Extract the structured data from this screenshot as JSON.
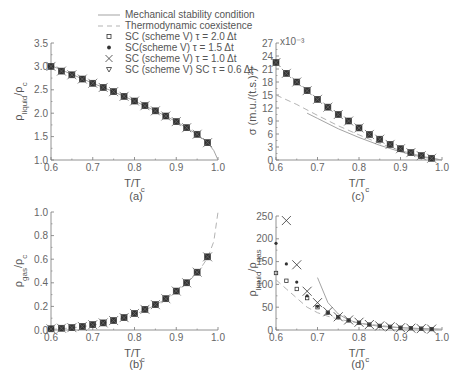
{
  "figure": {
    "legend": [
      {
        "marker": "solid-line",
        "label": "Mechanical stability condition"
      },
      {
        "marker": "dashed-line",
        "label": "Thermodynamic coexistence"
      },
      {
        "marker": "open-square",
        "label": "SC  (scheme V) τ = 2.0 Δt"
      },
      {
        "marker": "filled-circle",
        "label": "SC(scheme V) τ = 1.5 Δt"
      },
      {
        "marker": "cross",
        "label": "SC (scheme V) τ = 1.0 Δt"
      },
      {
        "marker": "open-triangle-down",
        "label": "SC (scheme V) SC τ = 0.6 Δt"
      }
    ],
    "colors": {
      "axis": "#777777",
      "marker": "#333333",
      "solid_line": "#999999",
      "dashed_line": "#aaaaaa",
      "text": "#555555"
    }
  },
  "chart_data": [
    {
      "panel": "(a)",
      "type": "line",
      "xlabel": "T/T_c",
      "ylabel": "ρ_liquid/ρ_c",
      "xlim": [
        0.6,
        1.0
      ],
      "ylim": [
        1.0,
        3.5
      ],
      "xticks": [
        "0.6",
        "0.7",
        "0.8",
        "0.9",
        "1.0"
      ],
      "yticks": [
        "1.0",
        "1.5",
        "2.0",
        "2.5",
        "3.0",
        "3.5"
      ],
      "x": [
        0.6,
        0.625,
        0.65,
        0.675,
        0.7,
        0.725,
        0.75,
        0.775,
        0.8,
        0.825,
        0.85,
        0.875,
        0.9,
        0.925,
        0.95,
        0.975
      ],
      "series": [
        {
          "name": "SC (scheme V) markers (all τ overlap)",
          "values": [
            3.0,
            2.9,
            2.82,
            2.73,
            2.64,
            2.55,
            2.46,
            2.36,
            2.26,
            2.16,
            2.05,
            1.94,
            1.82,
            1.69,
            1.55,
            1.37
          ]
        },
        {
          "name": "Mechanical stability condition",
          "line": "solid",
          "x": [
            0.6,
            0.65,
            0.7,
            0.75,
            0.8,
            0.85,
            0.9,
            0.95,
            0.975,
            0.99,
            1.0
          ],
          "values": [
            3.02,
            2.83,
            2.64,
            2.46,
            2.26,
            2.05,
            1.82,
            1.55,
            1.37,
            1.2,
            1.0
          ]
        }
      ]
    },
    {
      "panel": "(b)",
      "type": "line",
      "xlabel": "T/T_c",
      "ylabel": "ρ_gas/ρ_c",
      "xlim": [
        0.6,
        1.0
      ],
      "ylim": [
        0.0,
        1.0
      ],
      "xticks": [
        "0.6",
        "0.7",
        "0.8",
        "0.9",
        "1.0"
      ],
      "yticks": [
        "0.0",
        "0.2",
        "0.4",
        "0.6",
        "0.8",
        "1.0"
      ],
      "x": [
        0.6,
        0.625,
        0.65,
        0.675,
        0.7,
        0.725,
        0.75,
        0.775,
        0.8,
        0.825,
        0.85,
        0.875,
        0.9,
        0.925,
        0.95,
        0.975
      ],
      "series": [
        {
          "name": "SC (scheme V) markers (all τ overlap)",
          "values": [
            0.01,
            0.015,
            0.02,
            0.03,
            0.045,
            0.06,
            0.08,
            0.105,
            0.14,
            0.175,
            0.215,
            0.265,
            0.33,
            0.4,
            0.49,
            0.62
          ]
        },
        {
          "name": "Thermodynamic coexistence",
          "line": "dashed",
          "x": [
            0.6,
            0.65,
            0.7,
            0.75,
            0.8,
            0.85,
            0.9,
            0.95,
            0.975,
            0.99,
            1.0
          ],
          "values": [
            0.005,
            0.018,
            0.04,
            0.075,
            0.13,
            0.21,
            0.32,
            0.48,
            0.61,
            0.75,
            1.0
          ]
        }
      ]
    },
    {
      "panel": "(c)",
      "type": "line",
      "xlabel": "T/T_c",
      "ylabel": "σ (m.u./(t.s.)²)",
      "y_multiplier": "x10⁻³",
      "xlim": [
        0.6,
        1.0
      ],
      "ylim": [
        0,
        27
      ],
      "xticks": [
        "0.6",
        "0.7",
        "0.8",
        "0.9",
        "1.0"
      ],
      "yticks": [
        "0",
        "3",
        "6",
        "9",
        "12",
        "15",
        "18",
        "21",
        "24",
        "27"
      ],
      "x": [
        0.6,
        0.625,
        0.65,
        0.675,
        0.7,
        0.725,
        0.75,
        0.775,
        0.8,
        0.825,
        0.85,
        0.875,
        0.9,
        0.925,
        0.95,
        0.975
      ],
      "series": [
        {
          "name": "SC (scheme V) markers (all τ overlap)",
          "values": [
            22.5,
            20.0,
            18.0,
            16.0,
            14.0,
            12.2,
            10.5,
            9.0,
            7.4,
            5.9,
            4.8,
            3.6,
            2.6,
            1.7,
            1.0,
            0.4
          ]
        },
        {
          "name": "Thermodynamic coexistence",
          "line": "dashed",
          "x": [
            0.6,
            0.65,
            0.7,
            0.75,
            0.8,
            0.85,
            0.9,
            0.95,
            1.0
          ],
          "values": [
            15.0,
            12.8,
            10.3,
            7.9,
            5.8,
            3.8,
            2.2,
            0.9,
            0.0
          ]
        },
        {
          "name": "Mechanical stability condition",
          "line": "solid",
          "x": [
            0.675,
            0.7,
            0.75,
            0.8,
            0.85,
            0.9,
            0.95,
            1.0
          ],
          "values": [
            10.8,
            9.6,
            7.2,
            5.2,
            3.4,
            1.9,
            0.7,
            0.0
          ]
        }
      ]
    },
    {
      "panel": "(d)",
      "type": "scatter",
      "xlabel": "T/T_c",
      "ylabel": "ρ_liquid/ρ_gas",
      "xlim": [
        0.6,
        1.0
      ],
      "ylim": [
        0,
        250
      ],
      "xticks": [
        "0.6",
        "0.7",
        "0.8",
        "0.9",
        "1.0"
      ],
      "yticks": [
        "0",
        "50",
        "100",
        "150",
        "200",
        "250"
      ],
      "x": [
        0.6,
        0.625,
        0.65,
        0.675,
        0.7,
        0.725,
        0.75,
        0.775,
        0.8,
        0.825,
        0.85,
        0.875,
        0.9,
        0.925,
        0.95,
        0.975
      ],
      "series": [
        {
          "name": "SC (scheme V) τ = 2.0 Δt",
          "marker": "open-square",
          "values": [
            125,
            108,
            90,
            70,
            50,
            38,
            28,
            21,
            16,
            12,
            9,
            7,
            5,
            4,
            3,
            2
          ]
        },
        {
          "name": "SC(scheme V) τ = 1.5 Δt",
          "marker": "filled-circle",
          "values": [
            190,
            145,
            105,
            75,
            52,
            38,
            28,
            21,
            16,
            12,
            9,
            7,
            5,
            4,
            3,
            2
          ]
        },
        {
          "name": "SC (scheme V) τ = 1.0 Δt",
          "marker": "cross",
          "x": [
            0.625,
            0.65,
            0.675,
            0.7,
            0.725,
            0.75,
            0.775,
            0.8,
            0.825,
            0.85,
            0.875,
            0.9,
            0.925,
            0.95,
            0.975
          ],
          "values": [
            240,
            143,
            85,
            60,
            40,
            29,
            22,
            17,
            12,
            9,
            7,
            5,
            4,
            3,
            2
          ]
        },
        {
          "name": "Mechanical stability condition",
          "line": "solid",
          "x": [
            0.7,
            0.725,
            0.75,
            0.775,
            0.8,
            0.85,
            0.9,
            0.95,
            1.0
          ],
          "values": [
            115,
            60,
            35,
            22,
            15,
            8,
            5,
            3,
            2
          ]
        },
        {
          "name": "Thermodynamic coexistence",
          "line": "dashed",
          "x": [
            0.6,
            0.625,
            0.65,
            0.675,
            0.7,
            0.725,
            0.75,
            0.8,
            0.9,
            1.0
          ],
          "values": [
            110,
            90,
            70,
            50,
            38,
            30,
            24,
            15,
            5,
            1
          ]
        }
      ]
    }
  ]
}
